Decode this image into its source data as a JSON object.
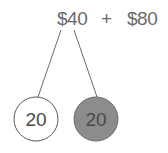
{
  "expression": {
    "left": "$40",
    "operator": "+",
    "right": "$80"
  },
  "circles": [
    {
      "label": "20",
      "fill": "#ffffff",
      "stroke": "#5a5a5a"
    },
    {
      "label": "20",
      "fill": "#8c8c8c",
      "stroke": "#6a6a6a"
    }
  ],
  "colors": {
    "text": "#6a6a6a",
    "line": "#5a5a5a"
  }
}
